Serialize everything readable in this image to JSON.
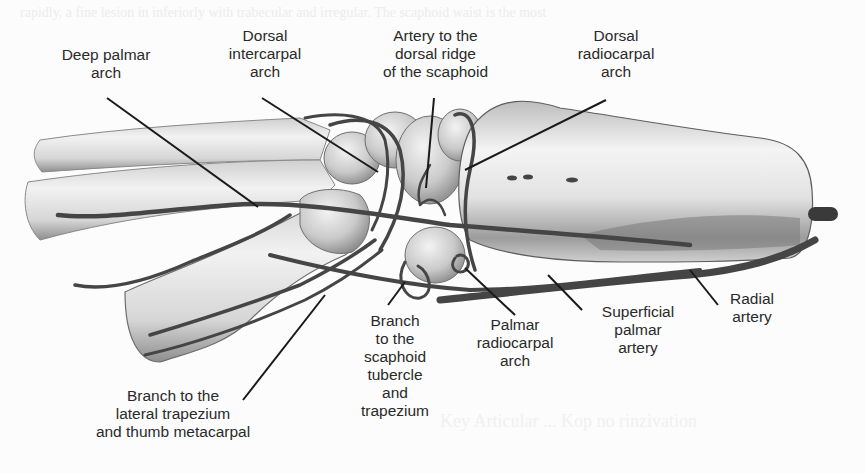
{
  "figure": {
    "colors": {
      "background": "#fcfcfc",
      "label_text": "#2a2a2a",
      "leader_line": "#1a1a1a",
      "bone_fill": "#e4e4e4",
      "bone_shadow": "#9a9a9a",
      "artery": "#4a4a4a"
    },
    "labels": {
      "deep_palmar_arch": "Deep palmar\narch",
      "dorsal_intercarpal_arch": "Dorsal\nintercarpal\narch",
      "artery_dorsal_ridge": "Artery to the\ndorsal ridge\nof the scaphoid",
      "dorsal_radiocarpal_arch": "Dorsal\nradiocarpal\narch",
      "branch_lateral_trapezium": "Branch to the\nlateral trapezium\nand thumb metacarpal",
      "branch_scaphoid_tubercle": "Branch\nto the\nscaphoid\ntubercle\nand\ntrapezium",
      "palmar_radiocarpal_arch": "Palmar\nradiocarpal\narch",
      "superficial_palmar_artery": "Superficial\npalmar\nartery",
      "radial_artery": "Radial\nartery"
    },
    "background_text": {
      "top": "rapidly, a fine lesion in inferiorly with trabecular and irregular. The scaphoid waist is the most",
      "bottom": "Key Articular ... Kop no rinzivation"
    }
  }
}
